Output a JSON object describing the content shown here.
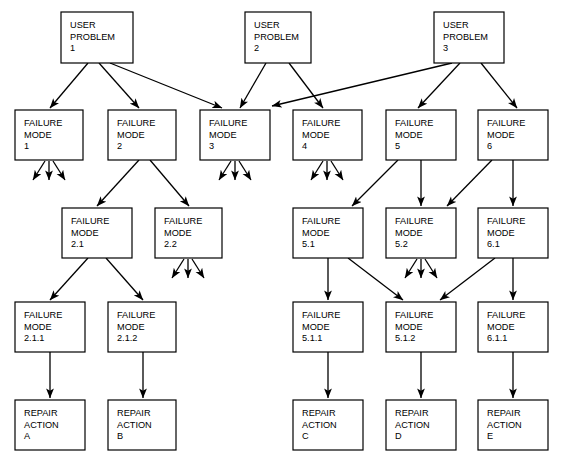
{
  "diagram": {
    "type": "tree-diagram",
    "background_color": "#ffffff",
    "line_color": "#000000",
    "box_fill": "#ffffff",
    "nodes": [
      {
        "id": "up1",
        "kind": "user-problem",
        "lines": [
          "USER",
          "PROBLEM",
          "1"
        ],
        "x": 61,
        "y": 12,
        "w": 72,
        "h": 51
      },
      {
        "id": "up2",
        "kind": "user-problem",
        "lines": [
          "USER",
          "PROBLEM",
          "2"
        ],
        "x": 245,
        "y": 12,
        "w": 66,
        "h": 51
      },
      {
        "id": "up3",
        "kind": "user-problem",
        "lines": [
          "USER",
          "PROBLEM",
          "3"
        ],
        "x": 434,
        "y": 12,
        "w": 70,
        "h": 51
      },
      {
        "id": "fm1",
        "kind": "failure-mode",
        "lines": [
          "FAILURE",
          "MODE",
          "1"
        ],
        "x": 15,
        "y": 110,
        "w": 68,
        "h": 50
      },
      {
        "id": "fm2",
        "kind": "failure-mode",
        "lines": [
          "FAILURE",
          "MODE",
          "2"
        ],
        "x": 108,
        "y": 110,
        "w": 68,
        "h": 50
      },
      {
        "id": "fm3",
        "kind": "failure-mode",
        "lines": [
          "FAILURE",
          "MODE",
          "3"
        ],
        "x": 200,
        "y": 110,
        "w": 70,
        "h": 50
      },
      {
        "id": "fm4",
        "kind": "failure-mode",
        "lines": [
          "FAILURE",
          "MODE",
          "4"
        ],
        "x": 293,
        "y": 110,
        "w": 69,
        "h": 50
      },
      {
        "id": "fm5",
        "kind": "failure-mode",
        "lines": [
          "FAILURE",
          "MODE",
          "5"
        ],
        "x": 386,
        "y": 110,
        "w": 70,
        "h": 50
      },
      {
        "id": "fm6",
        "kind": "failure-mode",
        "lines": [
          "FAILURE",
          "MODE",
          "6"
        ],
        "x": 478,
        "y": 110,
        "w": 70,
        "h": 50
      },
      {
        "id": "fm21",
        "kind": "failure-mode",
        "lines": [
          "FAILURE",
          "MODE",
          "2.1"
        ],
        "x": 62,
        "y": 208,
        "w": 70,
        "h": 50
      },
      {
        "id": "fm22",
        "kind": "failure-mode",
        "lines": [
          "FAILURE",
          "MODE",
          "2.2"
        ],
        "x": 155,
        "y": 208,
        "w": 67,
        "h": 50
      },
      {
        "id": "fm51",
        "kind": "failure-mode",
        "lines": [
          "FAILURE",
          "MODE",
          "5.1"
        ],
        "x": 293,
        "y": 208,
        "w": 70,
        "h": 50
      },
      {
        "id": "fm52",
        "kind": "failure-mode",
        "lines": [
          "FAILURE",
          "MODE",
          "5.2"
        ],
        "x": 386,
        "y": 208,
        "w": 70,
        "h": 50
      },
      {
        "id": "fm61",
        "kind": "failure-mode",
        "lines": [
          "FAILURE",
          "MODE",
          "6.1"
        ],
        "x": 478,
        "y": 208,
        "w": 70,
        "h": 50
      },
      {
        "id": "fm211",
        "kind": "failure-mode",
        "lines": [
          "FAILURE",
          "MODE",
          "2.1.1"
        ],
        "x": 15,
        "y": 302,
        "w": 70,
        "h": 50
      },
      {
        "id": "fm212",
        "kind": "failure-mode",
        "lines": [
          "FAILURE",
          "MODE",
          "2.1.2"
        ],
        "x": 108,
        "y": 302,
        "w": 68,
        "h": 50
      },
      {
        "id": "fm511",
        "kind": "failure-mode",
        "lines": [
          "FAILURE",
          "MODE",
          "5.1.1"
        ],
        "x": 293,
        "y": 302,
        "w": 70,
        "h": 50
      },
      {
        "id": "fm512",
        "kind": "failure-mode",
        "lines": [
          "FAILURE",
          "MODE",
          "5.1.2"
        ],
        "x": 386,
        "y": 302,
        "w": 70,
        "h": 50
      },
      {
        "id": "fm611",
        "kind": "failure-mode",
        "lines": [
          "FAILURE",
          "MODE",
          "6.1.1"
        ],
        "x": 478,
        "y": 302,
        "w": 70,
        "h": 50
      },
      {
        "id": "raA",
        "kind": "repair-action",
        "lines": [
          "REPAIR",
          "ACTION",
          "A"
        ],
        "x": 15,
        "y": 400,
        "w": 70,
        "h": 50
      },
      {
        "id": "raB",
        "kind": "repair-action",
        "lines": [
          "REPAIR",
          "ACTION",
          "B"
        ],
        "x": 108,
        "y": 400,
        "w": 68,
        "h": 50
      },
      {
        "id": "raC",
        "kind": "repair-action",
        "lines": [
          "REPAIR",
          "ACTION",
          "C"
        ],
        "x": 293,
        "y": 400,
        "w": 70,
        "h": 50
      },
      {
        "id": "raD",
        "kind": "repair-action",
        "lines": [
          "REPAIR",
          "ACTION",
          "D"
        ],
        "x": 386,
        "y": 400,
        "w": 70,
        "h": 50
      },
      {
        "id": "raE",
        "kind": "repair-action",
        "lines": [
          "REPAIR",
          "ACTION",
          "E"
        ],
        "x": 478,
        "y": 400,
        "w": 70,
        "h": 50
      }
    ],
    "edges": [
      {
        "from": "up1",
        "to": "fm1",
        "x1": 88,
        "y1": 63,
        "x2": 50,
        "y2": 108
      },
      {
        "from": "up1",
        "to": "fm2",
        "x1": 99,
        "y1": 63,
        "x2": 139,
        "y2": 108
      },
      {
        "from": "up1",
        "to": "fm3",
        "x1": 110,
        "y1": 63,
        "x2": 222,
        "y2": 108
      },
      {
        "from": "up2",
        "to": "fm3",
        "x1": 266,
        "y1": 63,
        "x2": 240,
        "y2": 108
      },
      {
        "from": "up2",
        "to": "fm4",
        "x1": 289,
        "y1": 63,
        "x2": 323,
        "y2": 108
      },
      {
        "from": "up3",
        "to": "fm3",
        "x1": 452,
        "y1": 63,
        "x2": 272,
        "y2": 106
      },
      {
        "from": "up3",
        "to": "fm5",
        "x1": 460,
        "y1": 63,
        "x2": 418,
        "y2": 108
      },
      {
        "from": "up3",
        "to": "fm6",
        "x1": 481,
        "y1": 63,
        "x2": 517,
        "y2": 108
      },
      {
        "from": "fm2",
        "to": "fm21",
        "x1": 139,
        "y1": 160,
        "x2": 97,
        "y2": 206
      },
      {
        "from": "fm2",
        "to": "fm22",
        "x1": 150,
        "y1": 160,
        "x2": 189,
        "y2": 206
      },
      {
        "from": "fm5",
        "to": "fm51",
        "x1": 398,
        "y1": 160,
        "x2": 352,
        "y2": 206
      },
      {
        "from": "fm5",
        "to": "fm52",
        "x1": 421,
        "y1": 160,
        "x2": 421,
        "y2": 206
      },
      {
        "from": "fm6",
        "to": "fm52",
        "x1": 492,
        "y1": 160,
        "x2": 447,
        "y2": 206
      },
      {
        "from": "fm6",
        "to": "fm61",
        "x1": 513,
        "y1": 160,
        "x2": 513,
        "y2": 206
      },
      {
        "from": "fm21",
        "to": "fm211",
        "x1": 88,
        "y1": 258,
        "x2": 50,
        "y2": 300
      },
      {
        "from": "fm21",
        "to": "fm212",
        "x1": 106,
        "y1": 258,
        "x2": 143,
        "y2": 300
      },
      {
        "from": "fm51",
        "to": "fm511",
        "x1": 328,
        "y1": 258,
        "x2": 328,
        "y2": 300
      },
      {
        "from": "fm51",
        "to": "fm512",
        "x1": 348,
        "y1": 258,
        "x2": 403,
        "y2": 300
      },
      {
        "from": "fm61",
        "to": "fm512",
        "x1": 495,
        "y1": 258,
        "x2": 440,
        "y2": 300
      },
      {
        "from": "fm61",
        "to": "fm611",
        "x1": 513,
        "y1": 258,
        "x2": 513,
        "y2": 300
      },
      {
        "from": "fm211",
        "to": "raA",
        "x1": 50,
        "y1": 352,
        "x2": 50,
        "y2": 398
      },
      {
        "from": "fm212",
        "to": "raB",
        "x1": 143,
        "y1": 352,
        "x2": 143,
        "y2": 398
      },
      {
        "from": "fm511",
        "to": "raC",
        "x1": 328,
        "y1": 352,
        "x2": 328,
        "y2": 398
      },
      {
        "from": "fm512",
        "to": "raD",
        "x1": 421,
        "y1": 352,
        "x2": 421,
        "y2": 398
      },
      {
        "from": "fm611",
        "to": "raE",
        "x1": 513,
        "y1": 352,
        "x2": 513,
        "y2": 398
      }
    ],
    "dangling_arrow_groups": [
      {
        "from": "fm1",
        "cx": 49,
        "y": 161,
        "spread": 16,
        "len": 19
      },
      {
        "from": "fm3",
        "cx": 235,
        "y": 161,
        "spread": 16,
        "len": 19
      },
      {
        "from": "fm4",
        "cx": 327,
        "y": 161,
        "spread": 16,
        "len": 19
      },
      {
        "from": "fm22",
        "cx": 188,
        "y": 259,
        "spread": 16,
        "len": 19
      },
      {
        "from": "fm52",
        "cx": 421,
        "y": 259,
        "spread": 16,
        "len": 19
      }
    ]
  }
}
